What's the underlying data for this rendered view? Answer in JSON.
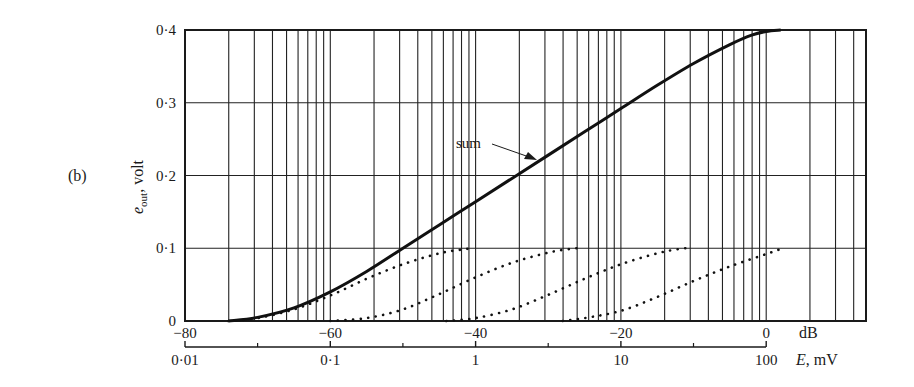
{
  "panel_label": "(b)",
  "y_axis_label_main": "e",
  "y_axis_label_sub": "out",
  "y_axis_label_unit": ", volt",
  "x_axis_db_unit": "dB",
  "x_axis_e_unit_italic": "E",
  "x_axis_e_unit_rest": ", mV",
  "annotation": "sum",
  "colors": {
    "ink": "#1a1a1a",
    "grid": "#222222",
    "background": "#ffffff"
  },
  "chart_data": {
    "type": "line",
    "title": "",
    "xlabel": "dB / E, mV (log scale)",
    "ylabel": "e_out, volt",
    "ylim": [
      0,
      0.4
    ],
    "xlim_db": [
      -80,
      10
    ],
    "y_ticks": [
      "0",
      "0·1",
      "0·2",
      "0·3",
      "0·4"
    ],
    "y_tick_values": [
      0,
      0.1,
      0.2,
      0.3,
      0.4
    ],
    "x_ticks_db": [
      "−80",
      "−60",
      "−40",
      "−20",
      "0"
    ],
    "x_tick_values_db": [
      -80,
      -60,
      -40,
      -20,
      0
    ],
    "x_ticks_mv": [
      "0·01",
      "0·1",
      "1",
      "10",
      "100"
    ],
    "x_tick_values_mv": [
      0.01,
      0.1,
      1,
      10,
      100
    ],
    "grid": {
      "horizontal": true,
      "vertical_log_decades": true
    },
    "series": [
      {
        "name": "sum",
        "style": "solid",
        "x_db": [
          -74,
          -70,
          -65,
          -60,
          -55,
          -50,
          -45,
          -40,
          -35,
          -30,
          -25,
          -20,
          -15,
          -10,
          -5,
          -2,
          0,
          2
        ],
        "values": [
          0.0,
          0.005,
          0.018,
          0.04,
          0.068,
          0.1,
          0.132,
          0.164,
          0.196,
          0.228,
          0.26,
          0.292,
          0.324,
          0.354,
          0.38,
          0.393,
          0.398,
          0.4
        ]
      },
      {
        "name": "stage 1",
        "style": "dotted",
        "x_db": [
          -74,
          -70,
          -65,
          -60,
          -55,
          -50,
          -45,
          -42,
          -40.5
        ],
        "values": [
          0.0,
          0.004,
          0.016,
          0.035,
          0.058,
          0.078,
          0.093,
          0.098,
          0.1
        ]
      },
      {
        "name": "stage 2",
        "style": "dotted",
        "x_db": [
          -60,
          -55,
          -50,
          -45,
          -40,
          -35,
          -30,
          -27,
          -26
        ],
        "values": [
          0.0,
          0.004,
          0.016,
          0.037,
          0.06,
          0.08,
          0.094,
          0.099,
          0.1
        ]
      },
      {
        "name": "stage 3",
        "style": "dotted",
        "x_db": [
          -44,
          -40,
          -35,
          -30,
          -25,
          -20,
          -15,
          -12,
          -11
        ],
        "values": [
          0.0,
          0.004,
          0.016,
          0.036,
          0.058,
          0.078,
          0.093,
          0.099,
          0.1
        ]
      },
      {
        "name": "stage 4",
        "style": "dotted",
        "x_db": [
          -28,
          -25,
          -20,
          -15,
          -10,
          -5,
          0,
          2,
          2.3
        ],
        "values": [
          0.0,
          0.004,
          0.014,
          0.033,
          0.055,
          0.075,
          0.092,
          0.099,
          0.1
        ]
      }
    ],
    "annotations": [
      {
        "text": "sum",
        "points_to_db": -33,
        "points_to_value": 0.21
      }
    ]
  }
}
